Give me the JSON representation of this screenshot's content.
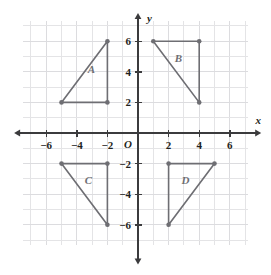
{
  "figure": {
    "kind": "coordinate-plane-with-triangles",
    "background_color": "#ffffff",
    "grid_color": "#e4e4e6",
    "axis_color": "#3b3b3d",
    "shape_color": "#6e6e73"
  },
  "chart_data": {
    "type": "scatter",
    "title": "",
    "xlabel": "x",
    "ylabel": "y",
    "xlim": [
      -7,
      7
    ],
    "ylim": [
      -7.5,
      7.5
    ],
    "grid": true,
    "grid_step": 1,
    "legend": "none",
    "origin_label": "O",
    "x_ticks": [
      -6,
      -4,
      -2,
      2,
      4,
      6
    ],
    "x_tick_labels": [
      "−6",
      "−4",
      "−2",
      "2",
      "4",
      "6"
    ],
    "y_ticks": [
      6,
      4,
      2,
      -2,
      -4,
      -6
    ],
    "y_tick_labels": [
      "6",
      "4",
      "2",
      "−2",
      "−4",
      "−6"
    ],
    "series": [
      {
        "name": "A",
        "label": "A",
        "label_position": [
          -3.05,
          3.95
        ],
        "closed": true,
        "points": [
          [
            -2,
            6
          ],
          [
            -2,
            2
          ],
          [
            -5,
            2
          ]
        ]
      },
      {
        "name": "B",
        "label": "B",
        "label_position": [
          2.65,
          4.65
        ],
        "closed": true,
        "points": [
          [
            1,
            6
          ],
          [
            4,
            6
          ],
          [
            4,
            2
          ]
        ]
      },
      {
        "name": "C",
        "label": "C",
        "label_position": [
          -3.25,
          -3.35
        ],
        "closed": true,
        "points": [
          [
            -5,
            -2
          ],
          [
            -2,
            -2
          ],
          [
            -2,
            -6
          ]
        ]
      },
      {
        "name": "D",
        "label": "D",
        "label_position": [
          3.1,
          -3.35
        ],
        "closed": true,
        "points": [
          [
            2,
            -2
          ],
          [
            5,
            -2
          ],
          [
            2,
            -6
          ]
        ]
      }
    ]
  },
  "axes": {
    "x_axis_name": "x",
    "y_axis_name": "y"
  }
}
